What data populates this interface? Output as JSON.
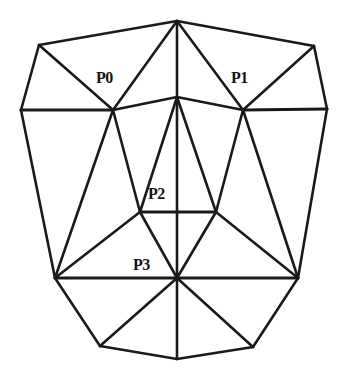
{
  "figure": {
    "type": "line-diagram",
    "width": 350,
    "height": 383,
    "background_color": "#ffffff",
    "line_color": "#1a1a1a",
    "label_color": "#141414"
  },
  "labels": [
    {
      "id": "P0",
      "text": "P0",
      "x": 96,
      "y": 70,
      "anchor_vertex": "left-cheek"
    },
    {
      "id": "P1",
      "text": "P1",
      "x": 231,
      "y": 70,
      "anchor_vertex": "right-cheek"
    },
    {
      "id": "P2",
      "text": "P2",
      "x": 148,
      "y": 186,
      "anchor_vertex": "nose-left"
    },
    {
      "id": "P3",
      "text": "P3",
      "x": 133,
      "y": 257,
      "anchor_vertex": "mouth-center"
    }
  ],
  "mesh": {
    "vertices": {
      "apex": {
        "x": 177,
        "y": 21
      },
      "top-left": {
        "x": 39,
        "y": 45
      },
      "top-right": {
        "x": 314,
        "y": 46
      },
      "brow-center": {
        "x": 177,
        "y": 97
      },
      "side-left": {
        "x": 21,
        "y": 110
      },
      "side-right": {
        "x": 327,
        "y": 109
      },
      "left-cheek": {
        "x": 113,
        "y": 110
      },
      "right-cheek": {
        "x": 243,
        "y": 110
      },
      "nose-left": {
        "x": 140,
        "y": 212
      },
      "nose-right": {
        "x": 216,
        "y": 212
      },
      "jaw-left": {
        "x": 55,
        "y": 278
      },
      "jaw-right": {
        "x": 298,
        "y": 278
      },
      "mouth-center": {
        "x": 177,
        "y": 278
      },
      "chin-left": {
        "x": 100,
        "y": 346
      },
      "chin-bottom": {
        "x": 177,
        "y": 359
      },
      "chin-right": {
        "x": 253,
        "y": 347
      }
    },
    "edges": [
      [
        "apex",
        "top-left"
      ],
      [
        "apex",
        "top-right"
      ],
      [
        "apex",
        "left-cheek"
      ],
      [
        "apex",
        "right-cheek"
      ],
      [
        "apex",
        "brow-center"
      ],
      [
        "top-left",
        "side-left"
      ],
      [
        "top-left",
        "left-cheek"
      ],
      [
        "top-right",
        "side-right"
      ],
      [
        "top-right",
        "right-cheek"
      ],
      [
        "side-left",
        "left-cheek"
      ],
      [
        "left-cheek",
        "brow-center"
      ],
      [
        "brow-center",
        "right-cheek"
      ],
      [
        "right-cheek",
        "side-right"
      ],
      [
        "side-left",
        "jaw-left"
      ],
      [
        "side-right",
        "jaw-right"
      ],
      [
        "left-cheek",
        "jaw-left"
      ],
      [
        "left-cheek",
        "nose-left"
      ],
      [
        "right-cheek",
        "jaw-right"
      ],
      [
        "right-cheek",
        "nose-right"
      ],
      [
        "brow-center",
        "nose-left"
      ],
      [
        "brow-center",
        "nose-right"
      ],
      [
        "brow-center",
        "mouth-center"
      ],
      [
        "nose-left",
        "nose-right"
      ],
      [
        "nose-left",
        "jaw-left"
      ],
      [
        "nose-left",
        "mouth-center"
      ],
      [
        "nose-right",
        "mouth-center"
      ],
      [
        "nose-right",
        "jaw-right"
      ],
      [
        "jaw-left",
        "mouth-center"
      ],
      [
        "mouth-center",
        "jaw-right"
      ],
      [
        "jaw-left",
        "chin-left"
      ],
      [
        "chin-left",
        "chin-bottom"
      ],
      [
        "chin-bottom",
        "chin-right"
      ],
      [
        "chin-right",
        "jaw-right"
      ],
      [
        "mouth-center",
        "chin-left"
      ],
      [
        "mouth-center",
        "chin-bottom"
      ],
      [
        "mouth-center",
        "chin-right"
      ]
    ],
    "thick_edges": [
      [
        "side-left",
        "left-cheek"
      ],
      [
        "right-cheek",
        "side-right"
      ],
      [
        "nose-left",
        "nose-right"
      ],
      [
        "jaw-left",
        "mouth-center"
      ],
      [
        "mouth-center",
        "jaw-right"
      ]
    ]
  },
  "chart_data": {
    "type": "scatter",
    "xlabel": "",
    "ylabel": "",
    "xlim": [
      0,
      350
    ],
    "ylim": [
      383,
      0
    ],
    "grid": false,
    "legend": "none",
    "annotations": [
      "P0",
      "P1",
      "P2",
      "P3"
    ],
    "points": [
      {
        "label": "P0",
        "x": 113,
        "y": 110
      },
      {
        "label": "P1",
        "x": 243,
        "y": 110
      },
      {
        "label": "P2",
        "x": 140,
        "y": 212
      },
      {
        "label": "P3",
        "x": 177,
        "y": 278
      }
    ]
  }
}
